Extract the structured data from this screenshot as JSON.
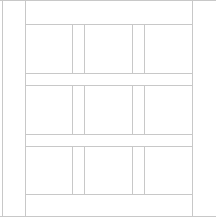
{
  "layout": {
    "line_color": "#c8c8c8",
    "background": "#ffffff",
    "frame": {
      "top_y": 0,
      "bottom_y": 216,
      "left_x": 2,
      "inner_left_x": 25,
      "right_x": 192
    },
    "grid": {
      "rows": 3,
      "columns": 3,
      "row_bands": [
        [
          24,
          73
        ],
        [
          85,
          134
        ],
        [
          146,
          194
        ]
      ],
      "column_bands": [
        [
          25,
          72
        ],
        [
          84,
          132
        ],
        [
          144,
          192
        ]
      ]
    }
  }
}
